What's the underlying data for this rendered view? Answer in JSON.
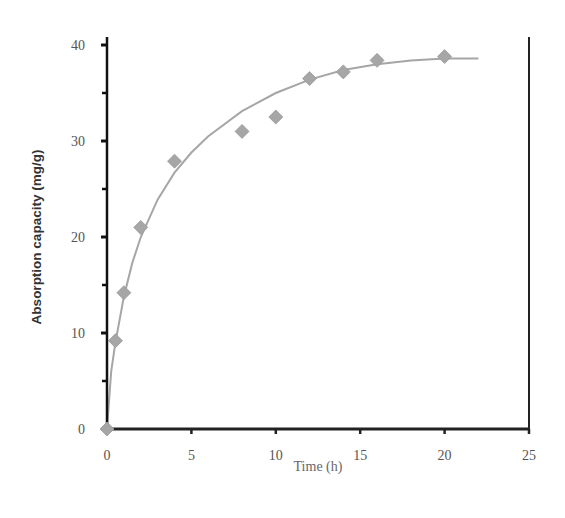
{
  "chart_data": {
    "type": "scatter",
    "title": "",
    "xlabel": "Time (h)",
    "ylabel": "Absorption capacity (mg/g)",
    "xlim": [
      0,
      25
    ],
    "ylim": [
      0,
      40
    ],
    "xticks": [
      0,
      5,
      10,
      15,
      20,
      25
    ],
    "yticks": [
      0,
      10,
      20,
      30,
      40
    ],
    "grid": false,
    "legend": "none",
    "series": [
      {
        "name": "Measured",
        "marker": "diamond",
        "color": "#a6a6a6",
        "x": [
          0,
          0.5,
          1,
          2,
          4,
          8,
          10,
          12,
          14,
          16,
          20
        ],
        "y": [
          0,
          9.2,
          14.2,
          21.0,
          27.9,
          31.0,
          32.5,
          36.5,
          37.2,
          38.4,
          38.8
        ]
      },
      {
        "name": "Fitted curve",
        "type": "line",
        "color": "#a6a6a6",
        "x": [
          0,
          0.25,
          0.5,
          1,
          1.5,
          2,
          3,
          4,
          5,
          6,
          8,
          10,
          12,
          14,
          16,
          18,
          20,
          22
        ],
        "y": [
          0,
          6.0,
          9.0,
          13.8,
          17.3,
          20.0,
          23.9,
          26.7,
          28.8,
          30.5,
          33.1,
          35.0,
          36.4,
          37.4,
          38.0,
          38.4,
          38.6,
          38.6
        ]
      }
    ]
  }
}
